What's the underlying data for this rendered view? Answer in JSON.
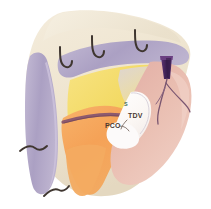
{
  "figure": {
    "background_color": "#ffffff",
    "width": 211,
    "height": 209
  },
  "labels": {
    "pco": "PCO",
    "tdv": "TDV",
    "small_green": "S"
  },
  "structures": {
    "skin_flap": {
      "name": "skin and subcutaneous flap",
      "color": "#efe6d2"
    },
    "fascia_edge": {
      "name": "fascial edge",
      "color": "#b0a6c6"
    },
    "fat_layer": {
      "name": "fatty tissue layer",
      "color": "#f3dd77"
    },
    "muscle_orange": {
      "name": "muscle belly",
      "color": "#f5a85a"
    },
    "organ_pink": {
      "name": "organ mass",
      "color": "#e7b5a9"
    },
    "peritoneum_white": {
      "name": "peritoneal window",
      "color": "#fdfbf8"
    },
    "vessel_band": {
      "name": "vascular band",
      "color": "#8d5a6e"
    },
    "trocar": {
      "name": "trocar cannula",
      "color": "#4c2a60"
    },
    "sutures": {
      "name": "suture hooks",
      "color": "#3f3630",
      "count": 5
    },
    "vessels": {
      "name": "branching vessels",
      "color": "#7a5670"
    }
  }
}
